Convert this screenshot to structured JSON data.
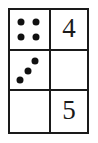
{
  "figure": {
    "kind": "dot-numeral-grid",
    "rows": 3,
    "columns": 2,
    "border_color": "#1a1a1a",
    "dot_color": "#111111",
    "background_color": "#ffffff",
    "cells": [
      {
        "row": 1,
        "column": 1,
        "type": "dots",
        "dot_count": 4,
        "arrangement": "square",
        "dots": [
          {
            "x_pct": 27,
            "y_pct": 30
          },
          {
            "x_pct": 66,
            "y_pct": 30
          },
          {
            "x_pct": 27,
            "y_pct": 68
          },
          {
            "x_pct": 66,
            "y_pct": 68
          }
        ]
      },
      {
        "row": 1,
        "column": 2,
        "type": "numeral",
        "value": "4"
      },
      {
        "row": 2,
        "column": 1,
        "type": "dots",
        "dot_count": 3,
        "arrangement": "diagonal",
        "dots": [
          {
            "x_pct": 64,
            "y_pct": 26
          },
          {
            "x_pct": 46,
            "y_pct": 52
          },
          {
            "x_pct": 25,
            "y_pct": 75
          }
        ]
      },
      {
        "row": 2,
        "column": 2,
        "type": "empty",
        "value": ""
      },
      {
        "row": 3,
        "column": 1,
        "type": "empty",
        "value": ""
      },
      {
        "row": 3,
        "column": 2,
        "type": "numeral",
        "value": "5"
      }
    ]
  }
}
